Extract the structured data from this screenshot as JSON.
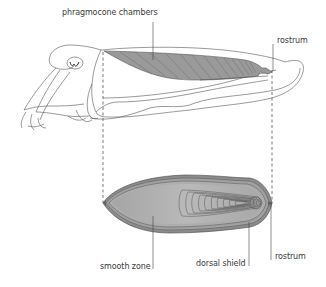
{
  "diagram": {
    "colors": {
      "outline": "#555555",
      "shell_fill": "#a6a6a6",
      "shell_fill_light": "#b8b8b8",
      "chamber_fill": "#9a9a9a",
      "label_text": "#3a3a3a",
      "background": "#ffffff"
    },
    "labels": {
      "phragmocone_chambers": "phragmocone chambers",
      "rostrum_top": "rostrum",
      "smooth_zone": "smooth zone",
      "dorsal_shield": "dorsal shield",
      "rostrum_bottom": "rostrum"
    }
  }
}
